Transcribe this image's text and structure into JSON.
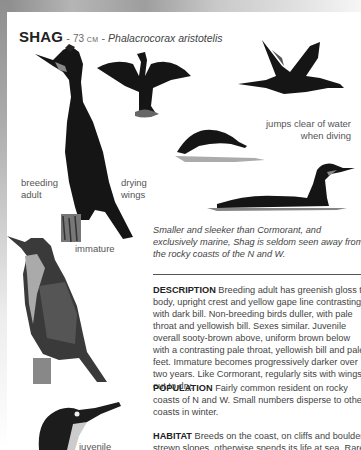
{
  "header": {
    "name": "SHAG",
    "separator": " - ",
    "size_number": "73",
    "size_unit": "CM",
    "separator2": " - ",
    "latin_name": "Phalacrocorax aristotelis"
  },
  "illustrations": [
    {
      "id": "breeding-adult",
      "label_line1": "breeding",
      "label_line2": "adult"
    },
    {
      "id": "drying-wings",
      "label_line1": "drying",
      "label_line2": "wings"
    },
    {
      "id": "flying",
      "label_line1": "",
      "label_line2": ""
    },
    {
      "id": "diving",
      "label_line1": "jumps clear of water",
      "label_line2": "when diving"
    },
    {
      "id": "swimming",
      "label_line1": "",
      "label_line2": ""
    },
    {
      "id": "immature",
      "label_line1": "immature",
      "label_line2": ""
    },
    {
      "id": "juvenile",
      "label_line1": "juvenile",
      "label_line2": ""
    }
  ],
  "caption": "Smaller and sleeker than Cormorant, and exclusively marine, Shag is seldom seen away from the rocky coasts of the N and W.",
  "sections": [
    {
      "heading": "DESCRIPTION",
      "text": "Breeding adult has greenish gloss to body, upright crest and yellow gape line contrasting with dark bill. Non-breeding birds duller, with pale throat and yellowish bill. Sexes similar. Juvenile overall sooty-brown above, uniform brown below with a contrasting pale throat, yellowish bill and pale feet. Immature becomes progressively darker over two years. Like Cormorant, regularly sits with wings out to dry."
    },
    {
      "heading": "POPULATION",
      "text": "Fairly common resident on rocky coasts of N and W. Small numbers disperse to other coasts in winter."
    },
    {
      "heading": "HABITAT",
      "text": "Breeds on the coast, on cliffs and boulder-strewn slopes, otherwise spends its life at sea. Rare"
    }
  ],
  "colors": {
    "bird_dark": "#151515",
    "bird_mid": "#4a4a4a",
    "text": "#444444",
    "heading": "#222222",
    "frame_gray": "#a0a0a0"
  }
}
